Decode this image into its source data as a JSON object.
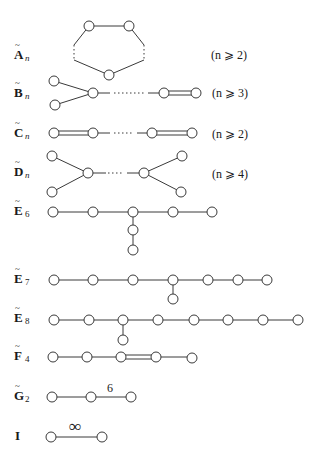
{
  "colors": {
    "stroke": "#3a3a3a",
    "text": "#1a1a1a",
    "background": "#ffffff"
  },
  "diagrams": [
    {
      "id": "A",
      "label": "A",
      "subscript": "n",
      "condition": "(n ⩾ 2)"
    },
    {
      "id": "B",
      "label": "B",
      "subscript": "n",
      "condition": "(n ⩾ 3)"
    },
    {
      "id": "C",
      "label": "C",
      "subscript": "n",
      "condition": "(n ⩾ 2)"
    },
    {
      "id": "D",
      "label": "D",
      "subscript": "n",
      "condition": "(n ⩾ 4)"
    },
    {
      "id": "E6",
      "label": "E",
      "subscript": "6"
    },
    {
      "id": "E7",
      "label": "E",
      "subscript": "7"
    },
    {
      "id": "E8",
      "label": "E",
      "subscript": "8"
    },
    {
      "id": "F4",
      "label": "F",
      "subscript": "4"
    },
    {
      "id": "G2",
      "label": "G",
      "subscript": "2",
      "edge_label": "6"
    },
    {
      "id": "I",
      "label": "I",
      "subscript": "",
      "edge_label": "∞"
    }
  ],
  "tilde": "~",
  "ellipsis": "· · ·"
}
